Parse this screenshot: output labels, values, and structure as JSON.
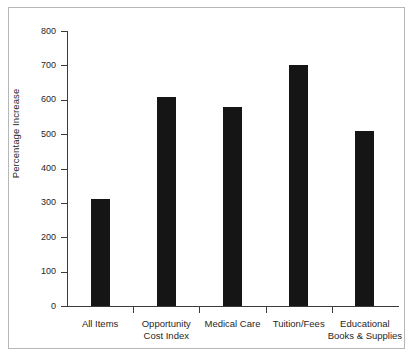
{
  "figure": {
    "clipped_caption": "",
    "frame_color": "#b7b7b7",
    "bar_color": "#151515",
    "axis_color": "#3b3b3b"
  },
  "chart_data": {
    "type": "bar",
    "title": "",
    "xlabel": "",
    "ylabel": "Percentage Increase",
    "ylim": [
      0,
      800
    ],
    "ytick_step": 100,
    "grid": false,
    "legend": "none",
    "categories": [
      "All Items",
      "Opportunity Cost Index",
      "Medical Care",
      "Tuition/Fees",
      "Educational Books & Supplies"
    ],
    "category_lines": [
      [
        "All Items"
      ],
      [
        "Opportunity",
        "Cost Index"
      ],
      [
        "Medical Care"
      ],
      [
        "Tuition/Fees"
      ],
      [
        "Educational",
        "Books & Supplies"
      ]
    ],
    "values": [
      310,
      607,
      578,
      700,
      510
    ],
    "ytick_labels": [
      "0",
      "100",
      "200",
      "300",
      "400",
      "500",
      "600",
      "700",
      "800"
    ]
  }
}
